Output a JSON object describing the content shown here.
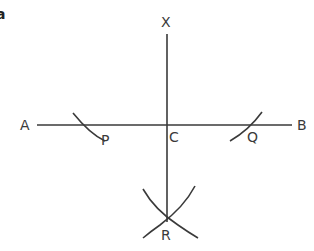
{
  "figure": {
    "corner_fragment": "a",
    "points": {
      "X": "X",
      "A": "A",
      "B": "B",
      "C": "C",
      "P": "P",
      "Q": "Q",
      "R": "R"
    }
  }
}
